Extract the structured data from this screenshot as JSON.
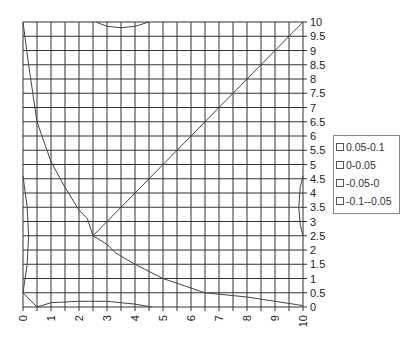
{
  "chart_data": {
    "type": "contour",
    "title": "",
    "xlabel": "",
    "ylabel": "",
    "xlim": [
      0,
      10
    ],
    "ylim": [
      0,
      10
    ],
    "x_ticks": [
      "0",
      "1",
      "2",
      "3",
      "4",
      "5",
      "6",
      "7",
      "8",
      "9",
      "10"
    ],
    "y_ticks": [
      "0",
      "0.5",
      "1",
      "1.5",
      "2",
      "2.5",
      "3",
      "3.5",
      "4",
      "4.5",
      "5",
      "5.5",
      "6",
      "6.5",
      "7",
      "7.5",
      "8",
      "8.5",
      "9",
      "9.5",
      "10"
    ],
    "grid": true,
    "grid_x_step": 0.5,
    "grid_y_step": 0.5,
    "legend_position": "right",
    "legend": [
      "0.05-0.1",
      "0-0.05",
      "-0.05-0",
      "-0.1--0.05"
    ],
    "series": [
      {
        "name": "diagonal-contour",
        "points": [
          [
            2.5,
            2.5
          ],
          [
            10,
            10
          ]
        ]
      },
      {
        "name": "upper-left-contour",
        "points": [
          [
            0,
            10
          ],
          [
            0.2,
            8.5
          ],
          [
            0.5,
            6.5
          ],
          [
            1,
            5.1
          ],
          [
            1.5,
            4.2
          ],
          [
            2,
            3.4
          ],
          [
            2.3,
            3.1
          ],
          [
            2.5,
            2.5
          ]
        ]
      },
      {
        "name": "lower-right-contour",
        "points": [
          [
            2.5,
            2.5
          ],
          [
            3,
            2.2
          ],
          [
            3.3,
            1.9
          ],
          [
            4,
            1.5
          ],
          [
            5,
            1.0
          ],
          [
            6.5,
            0.5
          ],
          [
            8,
            0.35
          ],
          [
            9,
            0.2
          ],
          [
            10,
            0.05
          ]
        ]
      },
      {
        "name": "top-arc",
        "points": [
          [
            2.6,
            10
          ],
          [
            3,
            9.85
          ],
          [
            3.5,
            9.8
          ],
          [
            4,
            9.85
          ],
          [
            4.5,
            10
          ]
        ]
      },
      {
        "name": "right-arc",
        "points": [
          [
            10,
            4.6
          ],
          [
            9.9,
            4.2
          ],
          [
            9.85,
            3.5
          ],
          [
            9.9,
            2.9
          ],
          [
            10,
            2.5
          ]
        ]
      },
      {
        "name": "left-arc",
        "points": [
          [
            0,
            4.6
          ],
          [
            0.15,
            3.5
          ],
          [
            0.2,
            2.5
          ],
          [
            0.15,
            1.5
          ],
          [
            0,
            0.5
          ]
        ]
      },
      {
        "name": "bottom-arc",
        "points": [
          [
            0,
            0.5
          ],
          [
            0.5,
            0
          ],
          [
            1,
            0.15
          ],
          [
            2,
            0.2
          ],
          [
            3,
            0.2
          ],
          [
            4,
            0.1
          ],
          [
            4.6,
            0
          ]
        ]
      }
    ]
  }
}
